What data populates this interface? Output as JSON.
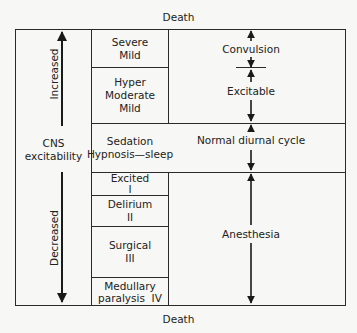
{
  "top_label": "Death",
  "bottom_label": "Death",
  "left_axis": {
    "title_line1": "CNS",
    "title_line2": "excitability",
    "increased": "Increased",
    "decreased": "Decreased"
  },
  "middle_column": [
    {
      "lines": [
        "Severe",
        "Mild"
      ]
    },
    {
      "lines": [
        "Hyper",
        "Moderate",
        "Mild"
      ]
    },
    {
      "lines": [
        "Sedation",
        "Hypnosis—sleep"
      ]
    },
    {
      "lines": [
        "Excited",
        "I"
      ]
    },
    {
      "lines": [
        "Delirium",
        "II"
      ]
    },
    {
      "lines": [
        "Surgical",
        "III"
      ]
    },
    {
      "lines": [
        "Medullary",
        "paralysis  IV"
      ]
    }
  ],
  "right_column": {
    "convulsion": "Convulsion",
    "excitable": "Excitable",
    "normal": "Normal diurnal cycle",
    "anesthesia": "Anesthesia"
  }
}
